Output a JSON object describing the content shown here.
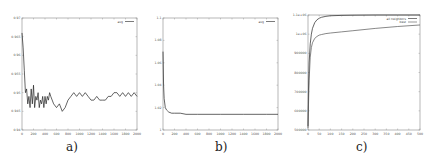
{
  "chart_data": [
    {
      "id": "a",
      "type": "line",
      "caption": "a)",
      "title": "",
      "xlabel": "",
      "ylabel": "",
      "xlim": [
        0,
        2000
      ],
      "ylim": [
        0.94,
        0.97
      ],
      "x_ticks": [
        "0",
        "200",
        "400",
        "600",
        "800",
        "1000",
        "1200",
        "1400",
        "1600",
        "1800",
        "2000"
      ],
      "y_ticks": [
        "0.94",
        "0.945",
        "0.95",
        "0.955",
        "0.96",
        "0.965",
        "0.97"
      ],
      "grid": false,
      "legend_position": "top-right",
      "series": [
        {
          "name": "avg",
          "x": [
            0,
            20,
            40,
            60,
            80,
            100,
            120,
            140,
            160,
            180,
            200,
            220,
            240,
            260,
            280,
            300,
            320,
            340,
            360,
            380,
            400,
            420,
            440,
            460,
            480,
            500,
            550,
            600,
            650,
            700,
            750,
            800,
            850,
            900,
            950,
            1000,
            1050,
            1100,
            1150,
            1200,
            1250,
            1300,
            1350,
            1400,
            1450,
            1500,
            1550,
            1600,
            1650,
            1700,
            1750,
            1800,
            1850,
            1900,
            1950,
            2000
          ],
          "values": [
            0.966,
            0.962,
            0.956,
            0.95,
            0.951,
            0.947,
            0.949,
            0.946,
            0.951,
            0.947,
            0.952,
            0.946,
            0.949,
            0.948,
            0.95,
            0.946,
            0.948,
            0.947,
            0.949,
            0.946,
            0.949,
            0.947,
            0.949,
            0.948,
            0.95,
            0.949,
            0.947,
            0.946,
            0.947,
            0.945,
            0.946,
            0.948,
            0.949,
            0.95,
            0.949,
            0.95,
            0.949,
            0.95,
            0.949,
            0.948,
            0.948,
            0.949,
            0.948,
            0.948,
            0.948,
            0.949,
            0.949,
            0.95,
            0.95,
            0.949,
            0.95,
            0.949,
            0.95,
            0.949,
            0.95,
            0.949
          ]
        }
      ]
    },
    {
      "id": "b",
      "type": "line",
      "caption": "b)",
      "title": "",
      "xlabel": "",
      "ylabel": "",
      "xlim": [
        0,
        2000
      ],
      "ylim": [
        1,
        1.1
      ],
      "x_ticks": [
        "0",
        "200",
        "400",
        "600",
        "800",
        "1000",
        "1200",
        "1400",
        "1600",
        "1800",
        "2000"
      ],
      "y_ticks": [
        "1",
        "1.02",
        "1.04",
        "1.06",
        "1.08",
        "1.1"
      ],
      "grid": false,
      "legend_position": "top-right",
      "series": [
        {
          "name": "avg",
          "x": [
            0,
            10,
            20,
            40,
            60,
            80,
            100,
            150,
            200,
            300,
            400,
            600,
            800,
            1000,
            1200,
            1400,
            1600,
            1800,
            2000
          ],
          "values": [
            1.07,
            1.04,
            1.028,
            1.02,
            1.018,
            1.017,
            1.016,
            1.015,
            1.015,
            1.015,
            1.014,
            1.014,
            1.014,
            1.014,
            1.014,
            1.014,
            1.014,
            1.014,
            1.014
          ]
        }
      ]
    },
    {
      "id": "c",
      "type": "line",
      "caption": "c)",
      "title": "",
      "xlabel": "",
      "ylabel": "",
      "xlim": [
        0,
        500
      ],
      "ylim": [
        500000,
        1100000
      ],
      "x_ticks": [
        "0",
        "50",
        "100",
        "150",
        "200",
        "250",
        "300",
        "350",
        "400",
        "450",
        "500"
      ],
      "y_ticks": [
        "500000",
        "600000",
        "700000",
        "800000",
        "900000",
        "1e+06",
        "1.1e+06"
      ],
      "grid": false,
      "legend_position": "top-right",
      "series": [
        {
          "name": "all neighbors",
          "x": [
            0,
            2,
            5,
            10,
            15,
            20,
            30,
            40,
            50,
            60,
            80,
            100,
            150,
            200,
            300,
            400,
            500
          ],
          "values": [
            520000,
            700000,
            850000,
            950000,
            1000000,
            1030000,
            1060000,
            1075000,
            1083000,
            1088000,
            1093000,
            1096000,
            1098000,
            1099000,
            1100000,
            1100000,
            1100000
          ]
        },
        {
          "name": "best",
          "x": [
            0,
            2,
            5,
            10,
            15,
            20,
            30,
            40,
            50,
            60,
            80,
            100,
            150,
            200,
            300,
            400,
            500
          ],
          "values": [
            510000,
            620000,
            760000,
            880000,
            930000,
            955000,
            978000,
            988000,
            995000,
            998000,
            1003000,
            1006000,
            1012000,
            1018000,
            1030000,
            1040000,
            1048000
          ]
        }
      ]
    }
  ]
}
